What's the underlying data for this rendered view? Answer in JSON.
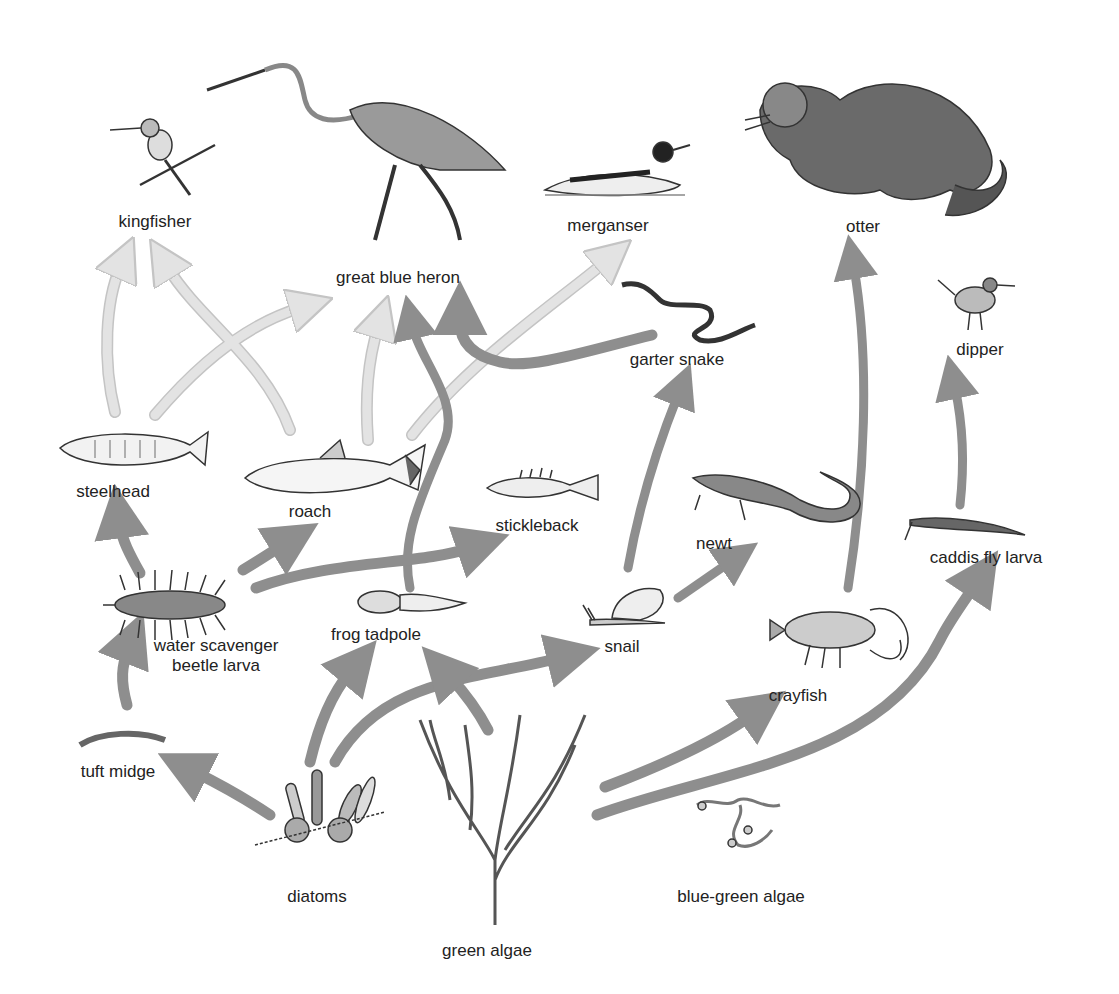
{
  "diagram": {
    "type": "food-web",
    "title": "",
    "colors": {
      "arrow_light": "#e3e3e3",
      "arrow_light_outline": "#c4c4c4",
      "arrow_dark": "#8e8e8e",
      "text": "#222222",
      "drawing": "#333333"
    },
    "organisms": [
      {
        "id": "kingfisher",
        "label": "kingfisher",
        "x": 155,
        "y": 222
      },
      {
        "id": "heron",
        "label": "great blue heron",
        "x": 398,
        "y": 285
      },
      {
        "id": "merganser",
        "label": "merganser",
        "x": 608,
        "y": 232
      },
      {
        "id": "otter",
        "label": "otter",
        "x": 850,
        "y": 233
      },
      {
        "id": "garter_snake",
        "label": "garter snake",
        "x": 677,
        "y": 361
      },
      {
        "id": "dipper",
        "label": "dipper",
        "x": 977,
        "y": 350
      },
      {
        "id": "steelhead",
        "label": "steelhead",
        "x": 120,
        "y": 496
      },
      {
        "id": "roach",
        "label": "roach",
        "x": 310,
        "y": 518
      },
      {
        "id": "stickleback",
        "label": "stickleback",
        "x": 537,
        "y": 525
      },
      {
        "id": "newt",
        "label": "newt",
        "x": 714,
        "y": 542
      },
      {
        "id": "caddis",
        "label": "caddis fly larva",
        "x": 985,
        "y": 558
      },
      {
        "id": "beetle",
        "label_lines": [
          "water scavenger",
          "beetle larva"
        ],
        "x": 216,
        "y": 647
      },
      {
        "id": "tadpole",
        "label": "frog tadpole",
        "x": 376,
        "y": 635
      },
      {
        "id": "snail",
        "label": "snail",
        "x": 622,
        "y": 647
      },
      {
        "id": "crayfish",
        "label": "crayfish",
        "x": 800,
        "y": 695
      },
      {
        "id": "tuft_midge",
        "label": "tuft midge",
        "x": 118,
        "y": 771
      },
      {
        "id": "diatoms",
        "label": "diatoms",
        "x": 317,
        "y": 897
      },
      {
        "id": "green_algae",
        "label": "green algae",
        "x": 487,
        "y": 950
      },
      {
        "id": "blue_green_algae",
        "label": "blue-green algae",
        "x": 602,
        "y": 897
      }
    ],
    "arrows": [
      {
        "from": "steelhead",
        "to": "kingfisher",
        "style": "light"
      },
      {
        "from": "roach",
        "to": "kingfisher",
        "style": "light"
      },
      {
        "from": "steelhead",
        "to": "heron",
        "style": "light"
      },
      {
        "from": "roach",
        "to": "heron",
        "style": "light"
      },
      {
        "from": "roach",
        "to": "merganser",
        "style": "light"
      },
      {
        "from": "tadpole",
        "to": "heron",
        "style": "dark"
      },
      {
        "from": "garter_snake",
        "to": "heron",
        "style": "dark"
      },
      {
        "from": "snail",
        "to": "garter_snake",
        "style": "dark"
      },
      {
        "from": "snail",
        "to": "newt",
        "style": "dark"
      },
      {
        "from": "crayfish",
        "to": "otter",
        "style": "dark"
      },
      {
        "from": "caddis",
        "to": "dipper",
        "style": "dark"
      },
      {
        "from": "beetle",
        "to": "steelhead",
        "style": "dark"
      },
      {
        "from": "beetle",
        "to": "roach",
        "style": "dark"
      },
      {
        "from": "beetle",
        "to": "stickleback",
        "style": "dark"
      },
      {
        "from": "tuft_midge",
        "to": "beetle",
        "style": "dark"
      },
      {
        "from": "diatoms",
        "to": "tuft_midge",
        "style": "dark"
      },
      {
        "from": "diatoms",
        "to": "tadpole",
        "style": "dark"
      },
      {
        "from": "diatoms",
        "to": "snail",
        "style": "dark"
      },
      {
        "from": "green_algae",
        "to": "tadpole",
        "style": "dark"
      },
      {
        "from": "green_algae",
        "to": "crayfish",
        "style": "dark"
      },
      {
        "from": "green_algae",
        "to": "caddis",
        "style": "dark"
      }
    ]
  }
}
